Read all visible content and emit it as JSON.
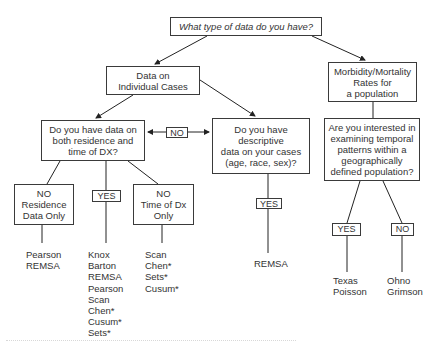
{
  "diagram": {
    "root": {
      "text": "What type of data do you have?"
    },
    "individual_cases": {
      "text": "Data on\nIndividual Cases"
    },
    "population_rates": {
      "text": "Morbidity/Mortality\nRates for\na population"
    },
    "residence_time_question": {
      "text": "Do you have data on\nboth residence and\ntime of DX?"
    },
    "descriptive_question": {
      "text": "Do you have\ndescriptive\ndata on your cases\n(age, race, sex)?"
    },
    "temporal_question": {
      "text": "Are you interested in\nexamining temporal\npatterns within a\ngeographically\ndefined population?"
    },
    "no_residence_only": {
      "text": "NO\nResidence\nData Only"
    },
    "no_time_only": {
      "text": "NO\nTime of Dx\nOnly"
    },
    "labels": {
      "no_between": "NO",
      "yes_both": "YES",
      "yes_descriptive": "YES",
      "yes_temporal": "YES",
      "no_temporal": "NO"
    },
    "methods": {
      "residence_only": [
        "Pearson",
        "REMSA"
      ],
      "both": [
        "Knox",
        "Barton",
        "REMSA",
        "Pearson",
        "Scan",
        "Chen*",
        "Cusum*",
        "Sets*"
      ],
      "time_only": [
        "Scan",
        "Chen*",
        "Sets*",
        "Cusum*"
      ],
      "descriptive": [
        "REMSA"
      ],
      "temporal_yes": [
        "Texas",
        "Poisson"
      ],
      "temporal_no": [
        "Ohno",
        "Grimson"
      ]
    }
  }
}
